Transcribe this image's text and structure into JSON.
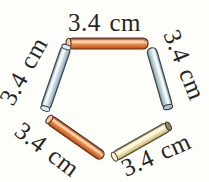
{
  "diagram": {
    "type": "pentagon-of-rods",
    "shape": "pentagon",
    "num_sides": 5,
    "side_length_text": "3.4 cm",
    "sides": [
      {
        "position": "top",
        "label": "3.4 cm",
        "rod_color": "orange"
      },
      {
        "position": "upper-right",
        "label": "3.4 cm",
        "rod_color": "blue"
      },
      {
        "position": "lower-right",
        "label": "3.4 cm",
        "rod_color": "yellow"
      },
      {
        "position": "lower-left",
        "label": "3.4 cm",
        "rod_color": "orange"
      },
      {
        "position": "upper-left",
        "label": "3.4 cm",
        "rod_color": "blue"
      }
    ],
    "colors": {
      "orange_body": "#e07a3c",
      "orange_highlight": "#f8d0a6",
      "orange_outline": "#5a3424",
      "blue_body": "#c9dae1",
      "blue_highlight": "#f3f9fb",
      "blue_outline": "#41484d",
      "yellow_body": "#efe6b0",
      "yellow_highlight": "#fdfae4",
      "yellow_outline": "#4e4836",
      "text": "#262626",
      "background": "#fdfdfa"
    }
  }
}
